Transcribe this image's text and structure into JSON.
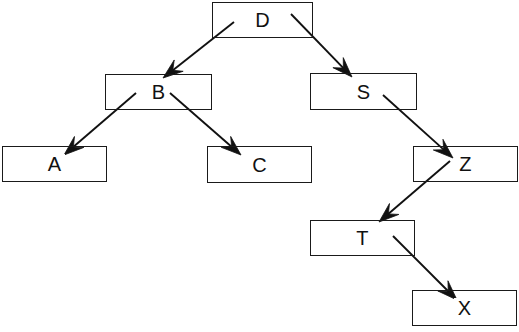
{
  "diagram": {
    "type": "tree-diagram",
    "canvas": {
      "width": 519,
      "height": 332,
      "background": "#ffffff"
    },
    "style": {
      "node_border_color": "#1a1a1a",
      "node_fill": "transparent",
      "edge_color": "#111111",
      "label_color": "#111111"
    },
    "nodes": [
      {
        "id": "D",
        "label": "D",
        "x": 212,
        "y": 2,
        "w": 101,
        "h": 36
      },
      {
        "id": "B",
        "label": "B",
        "x": 105,
        "y": 74,
        "w": 107,
        "h": 36
      },
      {
        "id": "S",
        "label": "S",
        "x": 310,
        "y": 73,
        "w": 107,
        "h": 37
      },
      {
        "id": "A",
        "label": "A",
        "x": 2,
        "y": 146,
        "w": 105,
        "h": 36
      },
      {
        "id": "C",
        "label": "C",
        "x": 207,
        "y": 146,
        "w": 105,
        "h": 37
      },
      {
        "id": "Z",
        "label": "Z",
        "x": 413,
        "y": 146,
        "w": 105,
        "h": 36
      },
      {
        "id": "T",
        "label": "T",
        "x": 310,
        "y": 220,
        "w": 105,
        "h": 36
      },
      {
        "id": "X",
        "label": "X",
        "x": 412,
        "y": 290,
        "w": 105,
        "h": 36
      }
    ],
    "edges": [
      {
        "from": "D",
        "to": "B",
        "x1": 234,
        "y1": 22,
        "x2": 163,
        "y2": 78
      },
      {
        "from": "D",
        "to": "S",
        "x1": 291,
        "y1": 14,
        "x2": 352,
        "y2": 77
      },
      {
        "from": "B",
        "to": "A",
        "x1": 136,
        "y1": 93,
        "x2": 64,
        "y2": 155
      },
      {
        "from": "B",
        "to": "C",
        "x1": 170,
        "y1": 93,
        "x2": 241,
        "y2": 155
      },
      {
        "from": "S",
        "to": "Z",
        "x1": 383,
        "y1": 95,
        "x2": 453,
        "y2": 158
      },
      {
        "from": "Z",
        "to": "T",
        "x1": 450,
        "y1": 161,
        "x2": 379,
        "y2": 222
      },
      {
        "from": "T",
        "to": "X",
        "x1": 393,
        "y1": 236,
        "x2": 457,
        "y2": 300
      }
    ]
  }
}
